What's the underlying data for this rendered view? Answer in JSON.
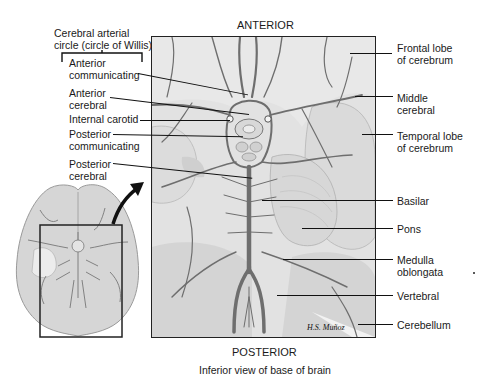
{
  "orientation": {
    "top": "ANTERIOR",
    "bottom": "POSTERIOR"
  },
  "caption": "Inferior view of base of brain",
  "artist_signature": "H.S. Muñoz",
  "group_label": {
    "line1": "Cerebral arterial",
    "line2": "circle (circle of Willis)"
  },
  "left_labels": [
    {
      "line1": "Anterior",
      "line2": "communicating"
    },
    {
      "line1": "Anterior",
      "line2": "cerebral"
    },
    {
      "line1": "Internal carotid",
      "line2": ""
    },
    {
      "line1": "Posterior",
      "line2": "communicating"
    },
    {
      "line1": "Posterior",
      "line2": "cerebral"
    }
  ],
  "right_labels": [
    {
      "line1": "Frontal lobe",
      "line2": "of cerebrum"
    },
    {
      "line1": "Middle",
      "line2": "cerebral"
    },
    {
      "line1": "Temporal lobe",
      "line2": "of cerebrum"
    },
    {
      "line1": "Basilar",
      "line2": ""
    },
    {
      "line1": "Pons",
      "line2": ""
    },
    {
      "line1": "Medulla",
      "line2": "oblongata"
    },
    {
      "line1": "Vertebral",
      "line2": ""
    },
    {
      "line1": "Cerebellum",
      "line2": ""
    }
  ],
  "colors": {
    "vessel": "#6e6e6e",
    "tissue": "#d9d9d9",
    "tissue_light": "#e9e9e9",
    "frame": "#222222"
  }
}
